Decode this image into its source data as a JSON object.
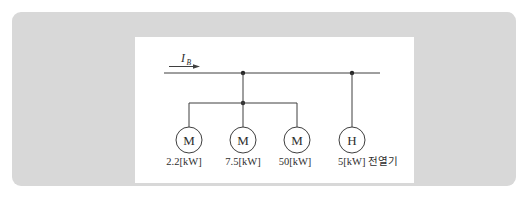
{
  "panel": {
    "background_color": "#d8d8d8"
  },
  "canvas": {
    "background_color": "#ffffff"
  },
  "diagram": {
    "current": {
      "symbol": "I",
      "subscript": "B"
    },
    "loads": [
      {
        "symbol": "M",
        "rating": "2.2[kW]"
      },
      {
        "symbol": "M",
        "rating": "7.5[kW]"
      },
      {
        "symbol": "M",
        "rating": "50[kW]"
      },
      {
        "symbol": "H",
        "rating": "5[kW] 전열기"
      }
    ],
    "colors": {
      "line": "#3f3f3f",
      "text": "#2e2e2e",
      "junction_dot": "#262626"
    }
  }
}
